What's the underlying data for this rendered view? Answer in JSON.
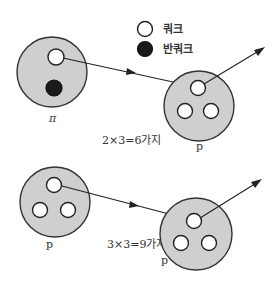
{
  "legend": {
    "quark_label": "쿼크",
    "antiquark_label": "반쿼크"
  },
  "particles": {
    "pion_label": "π",
    "proton_top_label": "p",
    "proton_bottom_left_label": "p",
    "proton_bottom_right_label": "p"
  },
  "formulas": {
    "pion_proton": "2×3=6가지",
    "proton_proton": "3×3=9가지"
  },
  "colors": {
    "hadron_fill": "#cfcfcf",
    "quark_fill": "#ffffff",
    "antiquark_fill": "#1a1a1a",
    "stroke": "#222222"
  }
}
